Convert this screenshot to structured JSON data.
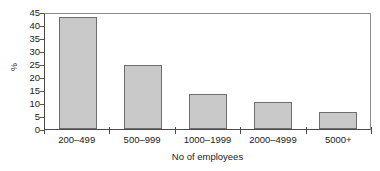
{
  "chart_data": {
    "type": "bar",
    "title": "",
    "subtitle": "",
    "xlabel": "No of employees",
    "ylabel": "%",
    "categories": [
      "200–499",
      "500–999",
      "1000–1999",
      "2000–4999",
      "5000+"
    ],
    "values": [
      43,
      24.5,
      13.5,
      10.5,
      6.5
    ],
    "series": [
      {
        "name": "%",
        "values": [
          43,
          24.5,
          13.5,
          10.5,
          6.5
        ]
      }
    ],
    "ylim": [
      0,
      45
    ],
    "yticks": [
      0,
      5,
      10,
      15,
      20,
      25,
      30,
      35,
      40,
      45
    ],
    "ytick_labels": [
      "0",
      "5",
      "10",
      "15",
      "20",
      "25",
      "30",
      "35",
      "40",
      "45"
    ],
    "grid": false,
    "legend": false,
    "legend_position": "none",
    "annotations": [],
    "colors": {
      "bar_fill": "#c9c9c9",
      "bar_border": "#6e6e6e",
      "axis": "#4a4a4a",
      "frame": "#8c8c8c",
      "text": "#1a1a1a",
      "background": "#ffffff"
    }
  }
}
